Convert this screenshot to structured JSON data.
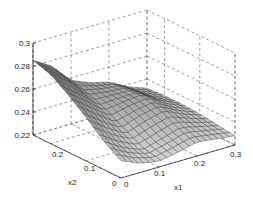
{
  "chart_data": {
    "type": "surface3d",
    "title": "",
    "xlabel": "x1",
    "ylabel": "x2",
    "zlabel": "",
    "xlim": [
      0,
      0.3
    ],
    "ylim": [
      0,
      0.25
    ],
    "zlim": [
      0.22,
      0.3
    ],
    "x_ticks": [
      "0",
      "0.1",
      "0.2",
      "0.3"
    ],
    "y_ticks": [
      "0",
      "0.1",
      "0.2"
    ],
    "z_ticks": [
      "0.22",
      "0.24",
      "0.26",
      "0.28",
      "0.3"
    ],
    "grid": true,
    "grid_style": "dashed",
    "colormap": "gray",
    "surface_description": "Smooth surface, highest (~0.285) near x1=0, x2=0.25; descends toward a trough (~0.225) near x1≈0.1, x2≈0.05; a second ridge (~0.25) around x1≈0.15–0.2, x2≈0.15; tapers to a thin lip near x1=0.3.",
    "surface_samples": {
      "x1": [
        0,
        0.05,
        0.1,
        0.15,
        0.2,
        0.25,
        0.3
      ],
      "x2": [
        0,
        0.05,
        0.1,
        0.15,
        0.2,
        0.25
      ],
      "z": [
        [
          0.235,
          0.228,
          0.225,
          0.228,
          0.232,
          0.23,
          0.228
        ],
        [
          0.245,
          0.235,
          0.228,
          0.233,
          0.238,
          0.234,
          0.23
        ],
        [
          0.258,
          0.246,
          0.236,
          0.242,
          0.246,
          0.238,
          0.232
        ],
        [
          0.27,
          0.258,
          0.245,
          0.248,
          0.25,
          0.24,
          0.233
        ],
        [
          0.28,
          0.268,
          0.252,
          0.25,
          0.249,
          0.239,
          0.233
        ],
        [
          0.285,
          0.275,
          0.258,
          0.251,
          0.247,
          0.238,
          0.232
        ]
      ]
    }
  }
}
